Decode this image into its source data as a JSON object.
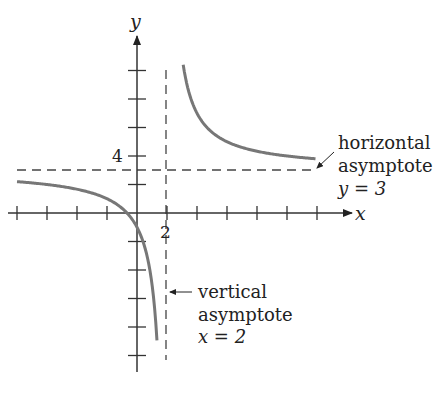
{
  "chart_data": {
    "type": "line",
    "title": "",
    "function": "y = 3 + 8/(x - 2)",
    "xlabel": "x",
    "ylabel": "y",
    "xlim": [
      -8,
      14
    ],
    "ylim": [
      -10,
      12
    ],
    "x_tick_step": 2,
    "y_tick_step": 2,
    "x_tick_labels": [
      {
        "value": 2,
        "label": "2"
      }
    ],
    "y_tick_labels": [
      {
        "value": 4,
        "label": "4"
      }
    ],
    "grid": false,
    "series": [
      {
        "name": "left branch",
        "x": [
          -8,
          -6,
          -4,
          -2,
          0,
          1,
          1.33
        ],
        "y": [
          2.2,
          2,
          1.67,
          1,
          -1,
          -5,
          -9
        ]
      },
      {
        "name": "right branch",
        "x": [
          3.1,
          4,
          6,
          8,
          10,
          12
        ],
        "y": [
          10.3,
          7,
          5,
          4.33,
          4,
          3.8
        ]
      }
    ],
    "asymptotes": [
      {
        "type": "horizontal",
        "value": 3
      },
      {
        "type": "vertical",
        "value": 2
      }
    ],
    "annotations": [
      {
        "lines": [
          "horizontal",
          "asymptote",
          "y = 3"
        ],
        "points_to": "horizontal asymptote"
      },
      {
        "lines": [
          "vertical",
          "asymptote",
          "x = 2"
        ],
        "points_to": "vertical asymptote"
      }
    ]
  },
  "labels": {
    "x_axis": "x",
    "y_axis": "y",
    "tick_2": "2",
    "tick_4": "4",
    "h_note_1": "horizontal",
    "h_note_2": "asymptote",
    "h_note_3": "y = 3",
    "v_note_1": "vertical",
    "v_note_2": "asymptote",
    "v_note_3": "x = 2"
  },
  "colors": {
    "curve": "#777777",
    "axis": "#333333",
    "dash": "#444444"
  }
}
